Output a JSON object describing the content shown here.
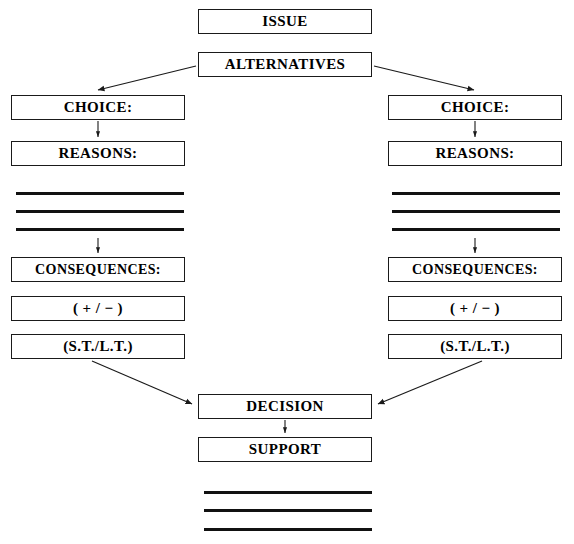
{
  "diagram": {
    "type": "flowchart",
    "background_color": "#ffffff",
    "line_color": "#1a1a1a",
    "text_color": "#000000",
    "nodes": {
      "issue": "ISSUE",
      "alternatives": "ALTERNATIVES",
      "choice_left": "CHOICE:",
      "reasons_left": "REASONS:",
      "consequences_left": "CONSEQUENCES:",
      "plus_minus_left": "( + / − )",
      "st_lt_left": "(S.T./L.T.)",
      "choice_right": "CHOICE:",
      "reasons_right": "REASONS:",
      "consequences_right": "CONSEQUENCES:",
      "plus_minus_right": "( + / − )",
      "st_lt_right": "(S.T./L.T.)",
      "decision": "DECISION",
      "support": "SUPPORT"
    },
    "blank_rules": {
      "left_count": 3,
      "right_count": 3,
      "bottom_count": 3
    },
    "connections": [
      {
        "from": "alternatives",
        "to": "choice_left",
        "style": "diagonal-arrow"
      },
      {
        "from": "alternatives",
        "to": "choice_right",
        "style": "diagonal-arrow"
      },
      {
        "from": "choice_left",
        "to": "reasons_left",
        "style": "vertical-arrow"
      },
      {
        "from": "choice_right",
        "to": "reasons_right",
        "style": "vertical-arrow"
      },
      {
        "from": "reasons_left_rules",
        "to": "consequences_left",
        "style": "vertical-arrow"
      },
      {
        "from": "reasons_right_rules",
        "to": "consequences_right",
        "style": "vertical-arrow"
      },
      {
        "from": "st_lt_left",
        "to": "decision",
        "style": "diagonal-arrow"
      },
      {
        "from": "st_lt_right",
        "to": "decision",
        "style": "diagonal-arrow"
      },
      {
        "from": "decision",
        "to": "support",
        "style": "vertical-arrow"
      }
    ]
  }
}
